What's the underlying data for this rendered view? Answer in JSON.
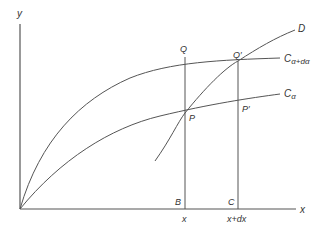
{
  "diagram": {
    "axes": {
      "x_label": "x",
      "y_label": "y"
    },
    "curves": [
      {
        "id": "C_alpha_plus_dalpha",
        "label_main": "C",
        "label_sub": "α+dα"
      },
      {
        "id": "C_alpha",
        "label_main": "C",
        "label_sub": "α"
      },
      {
        "id": "D",
        "label_main": "D"
      }
    ],
    "points": {
      "Q": "Q",
      "Q_prime": "Q′",
      "P": "P",
      "P_prime": "P′",
      "B": "B",
      "C": "C"
    },
    "ticks": {
      "x": "x",
      "x_plus_dx": "x+dx"
    },
    "colors": {
      "line": "#555555",
      "text": "#333333",
      "background": "#ffffff"
    }
  }
}
